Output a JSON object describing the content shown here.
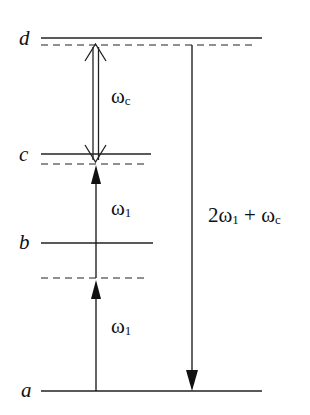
{
  "diagram": {
    "type": "energy-level-diagram",
    "levels": [
      {
        "id": "d",
        "label": "d"
      },
      {
        "id": "c",
        "label": "c"
      },
      {
        "id": "b",
        "label": "b"
      },
      {
        "id": "a",
        "label": "a"
      }
    ],
    "virtual_levels": [
      "below d",
      "below c",
      "between a and b"
    ],
    "transitions": [
      {
        "id": "omega1-lower",
        "symbol": "ω",
        "subscript": "1",
        "direction": "up",
        "from": "a",
        "to": "virtual level"
      },
      {
        "id": "omega1-upper",
        "symbol": "ω",
        "subscript": "1",
        "direction": "up",
        "from": "virtual level",
        "to": "virtual level below c"
      },
      {
        "id": "omegac",
        "symbol": "ω",
        "subscript": "c",
        "direction": "bidirectional",
        "style": "hollow double-line arrow",
        "from": "c",
        "to": "d"
      },
      {
        "id": "emission",
        "prefix": "2",
        "symbol": "ω",
        "subscript": "1",
        "suffix": " + ω",
        "suffix_sub": "c",
        "direction": "down",
        "from": "d",
        "to": "a"
      }
    ],
    "colors": {
      "line": "#111111",
      "background": "#ffffff"
    }
  }
}
